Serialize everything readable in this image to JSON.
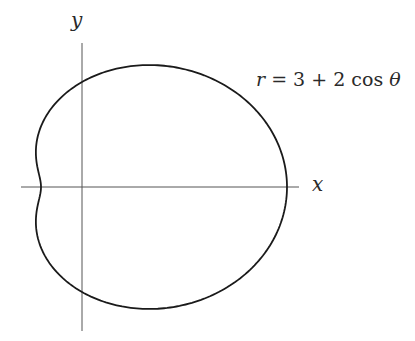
{
  "figure": {
    "equation_lhs": "r",
    "equation_eq": " = 3 + 2 cos ",
    "equation_theta": "θ",
    "x_axis_label": "x",
    "y_axis_label": "y"
  },
  "curve": {
    "type": "polar",
    "a": 3,
    "b": 2,
    "formula": "r = 3 + 2cosθ",
    "name": "limaçon (dimpled)"
  },
  "layout": {
    "origin_px": [
      82,
      187
    ],
    "scale_x": 41,
    "scale_y": 35,
    "x_axis_px": [
      21,
      299
    ],
    "y_axis_px": [
      43,
      331
    ],
    "stroke_color": "#1a1a1a",
    "axis_color": "#555555"
  }
}
